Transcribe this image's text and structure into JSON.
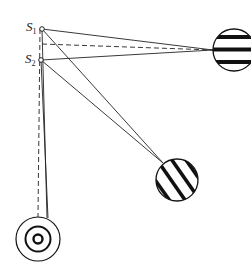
{
  "diagram": {
    "type": "two-slit interference observation geometry",
    "sources": [
      {
        "id": "S1",
        "label": "S",
        "subscript": "1",
        "x": 42,
        "y": 29
      },
      {
        "id": "S2",
        "label": "S",
        "subscript": "2",
        "x": 41,
        "y": 60
      }
    ],
    "screens": [
      {
        "id": "screen-right",
        "pattern": "horizontal-fringes",
        "cx": 234,
        "cy": 50,
        "r": 21
      },
      {
        "id": "screen-diagonal",
        "pattern": "oblique-fringes",
        "cx": 177,
        "cy": 180,
        "r": 21
      },
      {
        "id": "screen-bottom",
        "pattern": "concentric-rings",
        "cx": 38,
        "cy": 239,
        "r": 22
      }
    ],
    "colors": {
      "stroke": "#111111",
      "background": "#ffffff"
    }
  }
}
